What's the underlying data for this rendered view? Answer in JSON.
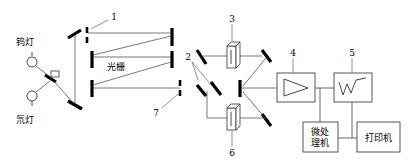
{
  "figure": {
    "width": 411,
    "height": 168,
    "background": "#ffffff",
    "line_color": "#555555",
    "optic_color": "#000000"
  },
  "labels": {
    "tungsten_lamp": "钨灯",
    "deuterium_lamp": "氘灯",
    "grating": "光栅",
    "microprocessor_line1": "微处",
    "microprocessor_line2": "理机",
    "printer": "打印机"
  },
  "callouts": {
    "slit_entrance": "1",
    "beam_splitter": "2",
    "sample_cell_upper": "3",
    "amplifier": "4",
    "recorder": "5",
    "sample_cell_lower": "6",
    "slit_exit": "7"
  },
  "components": {
    "sources": [
      {
        "name": "tungsten-lamp",
        "label": "钨灯",
        "type": "lamp"
      },
      {
        "name": "deuterium-lamp",
        "label": "氘灯",
        "type": "lamp"
      }
    ],
    "optics": [
      {
        "name": "source-select-mirror",
        "type": "mirror"
      },
      {
        "name": "collimating-mirror-top-left",
        "type": "mirror"
      },
      {
        "name": "collimating-mirror-bottom-left",
        "type": "mirror"
      },
      {
        "name": "grating",
        "type": "grating",
        "label": "光栅"
      },
      {
        "name": "mirror-top-right",
        "type": "mirror"
      },
      {
        "name": "mirror-mid-right",
        "type": "mirror"
      },
      {
        "name": "mirror-lower-left",
        "type": "mirror"
      },
      {
        "name": "entrance-slit",
        "type": "slit",
        "callout": "1"
      },
      {
        "name": "exit-slit",
        "type": "slit",
        "callout": "7"
      },
      {
        "name": "beam-splitter",
        "type": "chopper-mirror",
        "callout": "2"
      },
      {
        "name": "reference-cell",
        "type": "cuvette",
        "callout": "3"
      },
      {
        "name": "sample-cell",
        "type": "cuvette",
        "callout": "6"
      },
      {
        "name": "detector-mirror",
        "type": "mirror"
      }
    ],
    "electronics": [
      {
        "name": "amplifier",
        "callout": "4",
        "glyph": "triangle-amplifier"
      },
      {
        "name": "recorder",
        "callout": "5",
        "glyph": "spectrum-trace"
      },
      {
        "name": "microprocessor",
        "label": "微处理机"
      },
      {
        "name": "printer",
        "label": "打印机"
      }
    ]
  }
}
